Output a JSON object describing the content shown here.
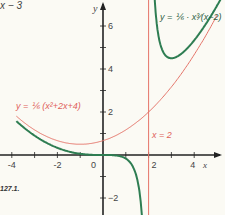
{
  "header": {
    "fragment": "x − 3"
  },
  "figure_label": "127.1.",
  "chart_data": {
    "type": "line",
    "title": "",
    "xlabel": "x",
    "ylabel": "y",
    "xlim": [
      -4.5,
      5.3
    ],
    "ylim": [
      -2.7,
      7.2
    ],
    "grid": false,
    "xticks": [
      -4,
      -3,
      -2,
      -1,
      0,
      1,
      2,
      3,
      4
    ],
    "xtick_labels": [
      "-4",
      "",
      "-2",
      "",
      "0",
      "",
      "2",
      "",
      "4"
    ],
    "yticks": [
      -2,
      -1,
      1,
      2,
      3,
      4,
      5,
      6
    ],
    "ytick_labels": [
      "−2",
      "",
      "",
      "2",
      "",
      "4",
      "",
      "6"
    ],
    "series": [
      {
        "name": "y = 1/6 · x³/(x−2)",
        "color": "#2e7d52",
        "formula": "x^3/(6*(x-2))",
        "domain_branches": [
          [
            -3.8,
            1.97
          ],
          [
            2.04,
            5.2
          ]
        ]
      },
      {
        "name": "y = 1/6 (x²+2x+4)",
        "color": "#e57368",
        "formula": "(x^2+2*x+4)/6",
        "domain_branches": [
          [
            -3.8,
            5.0
          ]
        ]
      }
    ],
    "asymptotes": [
      {
        "type": "vertical",
        "x": 2,
        "label": "x = 2",
        "color": "#e57368"
      }
    ],
    "annotations": [
      {
        "text": "y = 1/6 · x³/(x−2)",
        "near": [
          3.2,
          6.4
        ]
      },
      {
        "text": "y = 1/6 (x²+2x+4)",
        "near": [
          -2.5,
          2.2
        ]
      },
      {
        "text": "x = 2",
        "near": [
          2.5,
          1.2
        ]
      }
    ]
  },
  "labels": {
    "green_eq": "y = ⅙ · x³⁄(x−2)",
    "red_eq": "y = ⅙ (x²+2x+4)",
    "asymptote": "x = 2",
    "x_axis": "x",
    "y_axis": "y"
  }
}
